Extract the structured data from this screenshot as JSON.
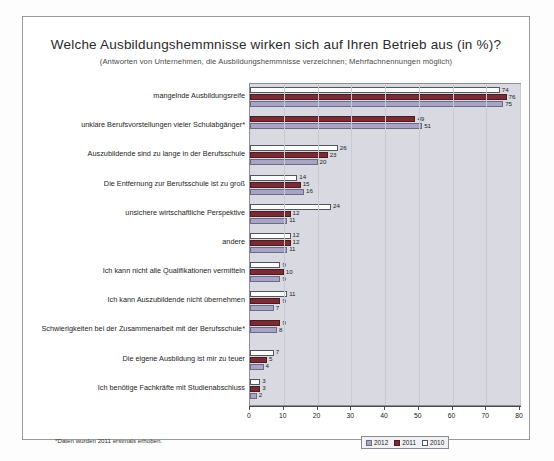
{
  "chart_data": {
    "type": "bar",
    "orientation": "horizontal",
    "title": "Welche Ausbildungshemmnisse wirken sich auf Ihren Betrieb aus (in %)?",
    "subtitle": "(Antworten von Unternehmen, die Ausbildungshemmnisse verzeichnen; Mehrfachnennungen möglich)",
    "xlabel": "",
    "ylabel": "",
    "xlim": [
      0,
      80
    ],
    "xticks": [
      0,
      10,
      20,
      30,
      40,
      50,
      60,
      70,
      80
    ],
    "grid": true,
    "legend_position": "bottom-right",
    "categories": [
      "mangelnde Ausbildungsreife",
      "unklare Berufsvorstellungen vieler Schulabgänger*",
      "Auszubildende sind zu lange in der Berufsschule",
      "Die Entfernung zur Berufsschule ist zu groß",
      "unsichere wirtschaftliche Perspektive",
      "andere",
      "Ich kann nicht alle Qualifikationen vermitteln",
      "Ich kann Auszubildende nicht übernehmen",
      "Schwierigkeiten bei der Zusammenarbeit mit der Berufsschule*",
      "Die eigene Ausbildung ist mir zu teuer",
      "Ich benötige Fachkräfte mit Studienabschluss"
    ],
    "series": [
      {
        "name": "2010",
        "color": "#ffffff",
        "values": [
          74,
          null,
          26,
          14,
          24,
          12,
          9,
          11,
          null,
          7,
          3
        ]
      },
      {
        "name": "2011",
        "color": "#7a2b36",
        "values": [
          76,
          49,
          23,
          15,
          12,
          12,
          10,
          9,
          9,
          5,
          3
        ]
      },
      {
        "name": "2012",
        "color": "#a9a4c3",
        "values": [
          75,
          51,
          20,
          16,
          11,
          11,
          9,
          7,
          8,
          4,
          2
        ]
      }
    ],
    "footnote": "*Daten wurden 2011 erstmals erhoben."
  },
  "legend": {
    "items": [
      {
        "label": "2012"
      },
      {
        "label": "2011"
      },
      {
        "label": "2010"
      }
    ]
  }
}
